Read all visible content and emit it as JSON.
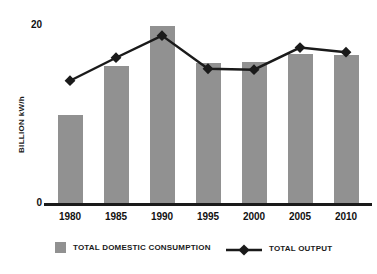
{
  "chart_data": {
    "type": "bar",
    "title": "",
    "subtitle": "",
    "xlabel": "",
    "ylabel": "BILLION kW/h",
    "categories": [
      "1980",
      "1985",
      "1990",
      "1995",
      "2000",
      "2005",
      "2010"
    ],
    "ylim": [
      0,
      20
    ],
    "yticks": [
      "0",
      "20"
    ],
    "ytick_values": [
      0,
      20
    ],
    "grid": false,
    "legend_position": "bottom",
    "series": [
      {
        "name": "TOTAL DOMESTIC CONSUMPTION",
        "type": "bar",
        "color": "#919191",
        "values": [
          9.7,
          15.0,
          19.3,
          15.3,
          15.4,
          16.3,
          16.2
        ]
      },
      {
        "name": "TOTAL OUTPUT",
        "type": "line",
        "color": "#1a1a1a",
        "marker": "diamond",
        "values": [
          13.4,
          15.9,
          18.3,
          14.7,
          14.6,
          17.0,
          16.5
        ]
      }
    ]
  },
  "axis": {
    "y_label": "BILLION kW/h",
    "y_max_label": "20",
    "y_min_label": "0"
  },
  "legend": {
    "bars_label": "TOTAL DOMESTIC CONSUMPTION",
    "line_label": "TOTAL OUTPUT",
    "bar_swatch_icon": "gray-square-icon",
    "line_swatch_icon": "line-diamond-marker-icon"
  },
  "colors": {
    "bar_fill": "#919191",
    "line_stroke": "#1a1a1a",
    "axis": "#1a1a1a",
    "text": "#1a1a1a",
    "background": "#ffffff"
  }
}
